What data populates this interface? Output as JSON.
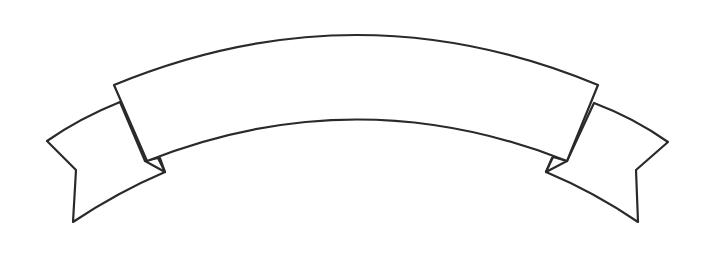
{
  "illustration": {
    "subject": "blank curved ribbon banner",
    "style": "line-art",
    "colors": {
      "stroke": "#2a2a2a",
      "fill": "#ffffff",
      "background": "#ffffff"
    },
    "banner_text": ""
  }
}
